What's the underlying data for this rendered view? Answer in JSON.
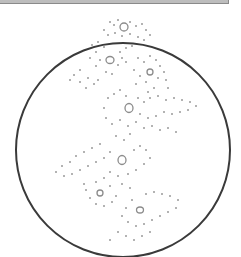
{
  "image": {
    "subject": "embroidery-hoop-lace-pattern",
    "hoop": {
      "cx": 123,
      "cy": 150,
      "r": 107,
      "stroke": "#3a3a3a"
    },
    "dot_color": "#9a9a9a",
    "flower_centers": [
      {
        "x": 124,
        "y": 27
      },
      {
        "x": 110,
        "y": 60
      },
      {
        "x": 150,
        "y": 72
      },
      {
        "x": 129,
        "y": 108
      },
      {
        "x": 122,
        "y": 160
      },
      {
        "x": 100,
        "y": 193
      },
      {
        "x": 140,
        "y": 210
      }
    ]
  }
}
